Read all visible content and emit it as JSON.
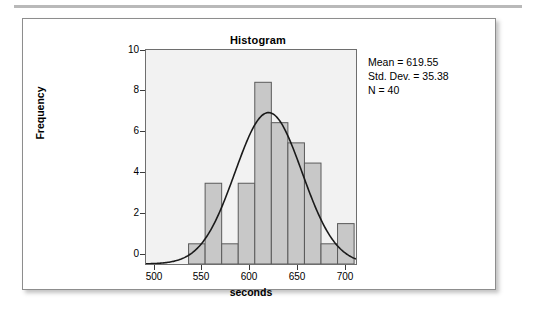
{
  "figure": {
    "title": "Histogram",
    "stats": {
      "mean": "Mean = 619.55",
      "std_dev": "Std. Dev. = 35.38",
      "n": "N = 40"
    }
  },
  "chart_data": {
    "type": "bar",
    "title": "Histogram",
    "xlabel": "seconds",
    "ylabel": "Frequency",
    "xlim": [
      490,
      712
    ],
    "ylim": [
      0,
      10.6
    ],
    "xticks": [
      500,
      550,
      600,
      650,
      700
    ],
    "yticks": [
      0,
      2,
      4,
      6,
      8,
      10
    ],
    "xtick_labels": [
      "500",
      "550",
      "600",
      "650",
      "700"
    ],
    "ytick_labels": [
      "0",
      "2",
      "4",
      "6",
      "8",
      "10"
    ],
    "grid": false,
    "legend": false,
    "bin_width": 17.5,
    "bin_edges": [
      535,
      552.5,
      570,
      587.5,
      605,
      622.5,
      640,
      657.5,
      675,
      692.5,
      710
    ],
    "bin_centers": [
      543.75,
      561.25,
      578.75,
      596.25,
      613.75,
      631.25,
      648.75,
      666.25,
      683.75,
      701.25
    ],
    "values": [
      1,
      4,
      1,
      4,
      9,
      7,
      6,
      5,
      1,
      2
    ],
    "bar_facecolor": "#c8c8c8",
    "bar_edgecolor": "#5a5a5a",
    "plot_background": "#f2f2f2",
    "overlay": {
      "type": "normal-curve",
      "mean": 619.55,
      "std_dev": 35.38,
      "n": 40,
      "peak_value": 7.5,
      "color": "#1a1a1a"
    },
    "annotations": [
      "Mean = 619.55",
      "Std. Dev. = 35.38",
      "N = 40"
    ]
  }
}
